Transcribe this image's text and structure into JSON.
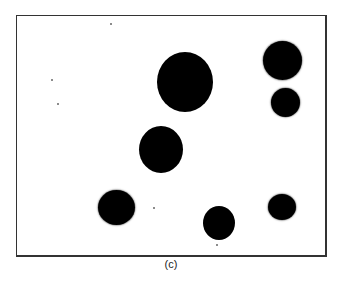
{
  "figure": {
    "caption": "(c)",
    "frame": {
      "x": 16,
      "y": 15,
      "width": 309,
      "height": 240,
      "border_color": "#333333"
    },
    "background_color": "#ffffff",
    "blob_color": "#000000",
    "blobs": [
      {
        "id": "large-center",
        "cx": 185,
        "cy": 82,
        "w": 56,
        "h": 60,
        "rough": false
      },
      {
        "id": "middle",
        "cx": 161,
        "cy": 149,
        "w": 44,
        "h": 47,
        "rough": false
      },
      {
        "id": "top-right",
        "cx": 282,
        "cy": 60,
        "w": 39,
        "h": 39,
        "rough": true
      },
      {
        "id": "right-upper-small",
        "cx": 285,
        "cy": 102,
        "w": 29,
        "h": 29,
        "rough": true
      },
      {
        "id": "bottom-left",
        "cx": 116,
        "cy": 207,
        "w": 37,
        "h": 35,
        "rough": true
      },
      {
        "id": "bottom-center",
        "cx": 219,
        "cy": 223,
        "w": 32,
        "h": 34,
        "rough": false
      },
      {
        "id": "bottom-right",
        "cx": 282,
        "cy": 207,
        "w": 28,
        "h": 26,
        "rough": true
      }
    ],
    "specks": [
      {
        "x": 110,
        "y": 23
      },
      {
        "x": 51,
        "y": 79
      },
      {
        "x": 57,
        "y": 103
      },
      {
        "x": 153,
        "y": 207
      },
      {
        "x": 216,
        "y": 244
      }
    ]
  }
}
